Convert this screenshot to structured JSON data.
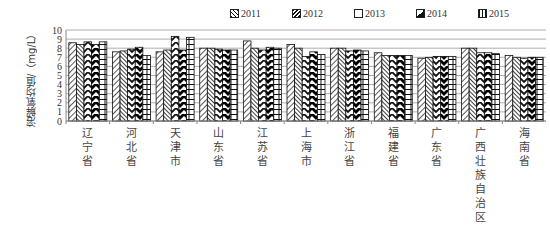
{
  "chart_data": {
    "type": "bar",
    "title": "",
    "xlabel": "",
    "ylabel": "溶解氧均值/（mg/L）",
    "ylim": [
      0,
      10
    ],
    "yticks": [
      0,
      1,
      2,
      3,
      4,
      5,
      6,
      7,
      8,
      9,
      10
    ],
    "grid": true,
    "legend_position": "top",
    "categories": [
      "辽宁省",
      "河北省",
      "天津市",
      "山东省",
      "江苏省",
      "上海市",
      "浙江省",
      "福建省",
      "广东省",
      "广西壮族自治区",
      "海南省"
    ],
    "series": [
      {
        "name": "2011",
        "pattern": "diagonal-lines",
        "values": [
          8.6,
          7.6,
          7.6,
          8.0,
          8.8,
          8.4,
          8.0,
          7.5,
          6.9,
          8.0,
          7.2
        ]
      },
      {
        "name": "2012",
        "pattern": "dense-diagonal",
        "values": [
          8.4,
          7.7,
          7.8,
          8.0,
          8.0,
          8.0,
          8.0,
          7.2,
          7.0,
          8.0,
          7.0
        ]
      },
      {
        "name": "2013",
        "pattern": "chevron-light",
        "values": [
          8.7,
          7.9,
          9.3,
          7.9,
          7.8,
          7.1,
          7.7,
          7.2,
          7.1,
          7.5,
          6.9
        ]
      },
      {
        "name": "2014",
        "pattern": "chevron-dark",
        "values": [
          8.4,
          8.1,
          7.8,
          7.8,
          8.1,
          7.6,
          7.8,
          7.2,
          7.1,
          7.5,
          7.0
        ]
      },
      {
        "name": "2015",
        "pattern": "brick",
        "values": [
          8.7,
          7.2,
          9.2,
          7.8,
          8.0,
          7.3,
          7.7,
          7.2,
          7.1,
          7.4,
          7.0
        ]
      }
    ]
  }
}
